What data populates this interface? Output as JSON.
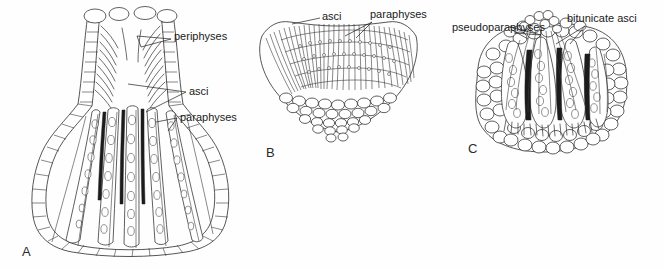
{
  "figure": {
    "background_color": "#ffffff",
    "ink_color": "#2b2b2b",
    "label_color": "#1a1a1a"
  },
  "panels": [
    {
      "letter": "A",
      "name": "perithecium",
      "letter_x": 22,
      "letter_y": 256,
      "labels": [
        {
          "text": "periphyses",
          "x": 174,
          "y": 40,
          "anchor": "start"
        },
        {
          "text": "asci",
          "x": 189,
          "y": 95,
          "anchor": "start"
        },
        {
          "text": "paraphyses",
          "x": 180,
          "y": 121,
          "anchor": "start"
        }
      ]
    },
    {
      "letter": "B",
      "name": "apothecium",
      "letter_x": 266,
      "letter_y": 157,
      "labels": [
        {
          "text": "asci",
          "x": 322,
          "y": 20,
          "anchor": "start"
        },
        {
          "text": "paraphyses",
          "x": 370,
          "y": 18,
          "anchor": "start"
        }
      ]
    },
    {
      "letter": "C",
      "name": "pseudothecium",
      "letter_x": 468,
      "letter_y": 153,
      "labels": [
        {
          "text": "pseudoparaphyses",
          "x": 452,
          "y": 31,
          "anchor": "start"
        },
        {
          "text": "bitunicate asci",
          "x": 567,
          "y": 22,
          "anchor": "start"
        }
      ]
    }
  ],
  "structures": {
    "panel_a": {
      "description": "flask-shaped perithecium with long neck, ostiolar canal lined with periphyses, venter containing elongate cylindrical asci with ascospores among paraphyses, wall of rectangular peridium cells",
      "ascus_count": 7,
      "spores_per_ascus": 8
    },
    "panel_b": {
      "description": "cup-shaped apothecium, broad open hymenium of parallel asci and paraphyses over a cellular excipulum",
      "hymenium_element_count": 46
    },
    "panel_c": {
      "description": "globose pseudothecium with thick pseudoparenchymatous wall, clavate bitunicate asci separated by pseudoparaphyses",
      "ascus_count": 6,
      "spores_per_ascus": 7
    }
  }
}
